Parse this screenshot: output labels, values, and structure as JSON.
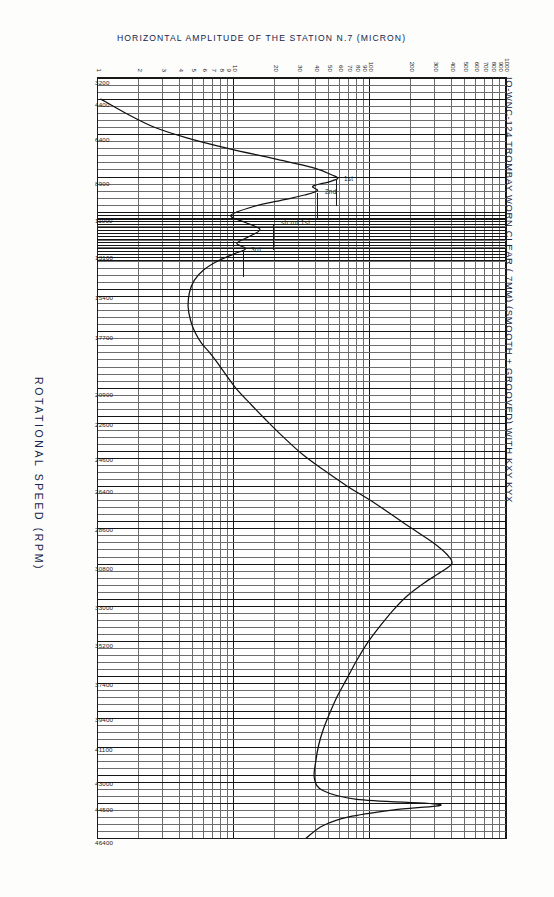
{
  "heading": {
    "line1": "IO-WNC-124 TROMBAY WORN CLEAR (.7MM) (SMOOTH + GROOVED) WITH KXY KYX",
    "line2": "FREQUENCY WET SHAFT NON-SYNCHRONOUS RESPONSE (BAL DRUM 8·25 SMOOTH)"
  },
  "axes": {
    "x_title": "ROTATIONAL SPEED  (RPM)",
    "y_title": "HORIZONTAL AMPLITUDE OF THE STATION N.7     (MICRON)",
    "x_ticks": [
      "3200",
      "4400",
      "6400",
      "8900",
      "11000",
      "13100",
      "15400",
      "17700",
      "20900",
      "22600",
      "24600",
      "26400",
      "28600",
      "30800",
      "33000",
      "35200",
      "37400",
      "39400",
      "41100",
      "43000",
      "44500",
      "46400"
    ],
    "y_ticks": [
      "1",
      "2",
      "3",
      "4",
      "5",
      "6",
      "7",
      "8",
      "9",
      "10",
      "20",
      "30",
      "40",
      "50",
      "60",
      "70",
      "80",
      "90",
      "100",
      "200",
      "300",
      "400",
      "500",
      "600",
      "700",
      "800",
      "900",
      "1000"
    ],
    "y_labelled": [
      "1",
      "2",
      "3",
      "4",
      "5",
      "6",
      "7",
      "8",
      "9",
      "10",
      "20",
      "30",
      "40",
      "50",
      "60",
      "70",
      "80",
      "90",
      "100",
      "200",
      "300",
      "400",
      "500",
      "600",
      "700",
      "800",
      "900",
      "1000"
    ],
    "x_min": 3200,
    "x_max": 46400,
    "y_min": 1,
    "y_max": 1000,
    "y_scale": "log",
    "x_scale": "linear"
  },
  "annotations": [
    {
      "label": "1st",
      "x": 8900,
      "y": 58
    },
    {
      "label": "2nd",
      "x": 9600,
      "y": 42
    },
    {
      "label": "3rd",
      "x": 12900,
      "y": 12
    },
    {
      "label": "sh.rot.1st",
      "x": 11400,
      "y": 20
    }
  ],
  "colors": {
    "grid_minor": "#6d6d6d",
    "grid_major": "#161616",
    "curve": "#111111",
    "text": "#15244a",
    "paper": "#fdfdfc"
  },
  "chart_data": {
    "type": "line",
    "title": "IO-WNC-124 TROMBAY WORN CLEAR (.7MM) (SMOOTH + GROOVED) WITH KXY KYX FREQUENCY WET SHAFT NON-SYNCHRONOUS RESPONSE (BAL DRUM 8·25 SMOOTH)",
    "xlabel": "ROTATIONAL SPEED  (RPM)",
    "ylabel": "HORIZONTAL AMPLITUDE OF THE STATION N.7  (MICRON)",
    "xlim": [
      3200,
      46400
    ],
    "ylim": [
      1,
      1000
    ],
    "xscale": "linear",
    "yscale": "log",
    "grid": true,
    "legend": "none",
    "series": [
      {
        "name": "Horizontal amplitude station N.7",
        "x": [
          4400,
          5200,
          6000,
          6600,
          7200,
          7800,
          8300,
          8700,
          8900,
          9100,
          9350,
          9600,
          9850,
          10100,
          10500,
          11000,
          11400,
          11800,
          12200,
          12600,
          12900,
          13200,
          13600,
          14100,
          14700,
          15400,
          16200,
          17000,
          17700,
          18300,
          18800,
          19300,
          20000,
          20900,
          21800,
          22600,
          23600,
          24600,
          25500,
          26400,
          27400,
          28600,
          29600,
          30300,
          30800,
          31300,
          31900,
          32600,
          33400,
          34300,
          35200,
          36300,
          37400,
          38400,
          39400,
          40300,
          41100,
          42000,
          43000,
          43700,
          44200,
          44500,
          44800,
          45200,
          45700,
          46400
        ],
        "y": [
          1.05,
          1.6,
          2.6,
          4.5,
          9.0,
          20.0,
          38.0,
          52.0,
          58.0,
          50.0,
          38.0,
          41.0,
          33.0,
          24.0,
          14.0,
          9.5,
          12.0,
          15.5,
          13.0,
          10.5,
          12.2,
          10.0,
          7.6,
          6.0,
          5.1,
          4.7,
          4.6,
          4.8,
          5.2,
          5.8,
          6.6,
          7.4,
          8.6,
          10.5,
          13.5,
          17.0,
          23.0,
          32.0,
          46.0,
          68.0,
          110.0,
          185.0,
          290.0,
          370.0,
          400.0,
          330.0,
          250.0,
          190.0,
          150.0,
          120.0,
          98.0,
          80.0,
          67.0,
          57.0,
          50.0,
          45.0,
          42.0,
          40.0,
          39.0,
          45.0,
          80.0,
          330.0,
          150.0,
          70.0,
          45.0,
          34.0
        ]
      }
    ]
  }
}
